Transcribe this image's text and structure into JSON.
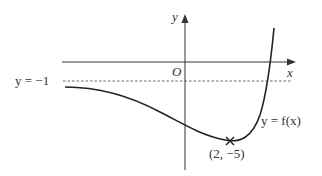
{
  "diagram": {
    "type": "function-graph",
    "axes": {
      "x_label": "x",
      "y_label": "y",
      "origin_label": "O"
    },
    "asymptote": {
      "label": "y = −1",
      "y_value": -1,
      "style": "dashed"
    },
    "curve": {
      "label": "y = f(x)"
    },
    "minimum_point": {
      "label": "(2, −5)",
      "x": 2,
      "y": -5,
      "marker": "cross"
    },
    "colors": {
      "line": "#222222",
      "axis": "#333333",
      "dashed": "#555555",
      "text": "#333333"
    }
  }
}
